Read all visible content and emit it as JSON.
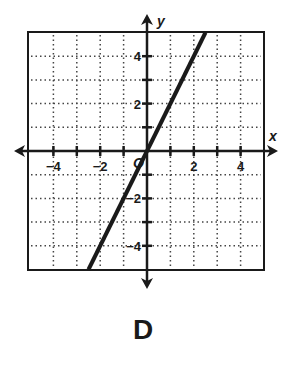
{
  "option_label": "D",
  "chart_data": {
    "type": "line",
    "title": "",
    "xlabel": "x",
    "ylabel": "y",
    "xlim": [
      -5,
      5
    ],
    "ylim": [
      -5,
      5
    ],
    "grid": true,
    "grid_style": "dotted",
    "origin_label": "O",
    "x_tick_labels": [
      "-4",
      "-2",
      "2",
      "4"
    ],
    "x_tick_label_values": [
      -4,
      -2,
      2,
      4
    ],
    "y_tick_labels": [
      "4",
      "2",
      "-2",
      "-4"
    ],
    "y_tick_label_values": [
      4,
      2,
      -2,
      -4
    ],
    "x_ticks": [
      -4,
      -3,
      -2,
      -1,
      1,
      2,
      3,
      4
    ],
    "y_ticks": [
      -4,
      -3,
      -2,
      -1,
      1,
      2,
      3,
      4
    ],
    "series": [
      {
        "name": "line",
        "equation": "y = 2x",
        "slope": 2,
        "intercept": 0,
        "x": [
          -2.5,
          0,
          2.5
        ],
        "y": [
          -5,
          0,
          5
        ]
      }
    ],
    "line_color": "#1a1a1a"
  }
}
